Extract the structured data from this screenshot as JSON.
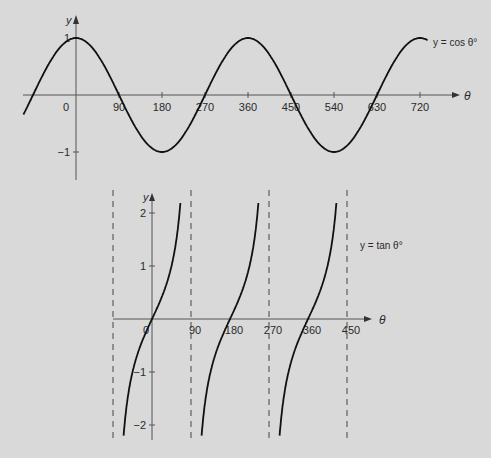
{
  "chart_data": [
    {
      "type": "line",
      "title": "",
      "legend_label": "y = cos θ°",
      "xlabel": "θ",
      "ylabel": "y",
      "x_ticks": [
        0,
        90,
        180,
        270,
        360,
        450,
        540,
        630,
        720
      ],
      "y_ticks": [
        1,
        -1
      ],
      "xlim": [
        -110,
        737
      ],
      "ylim": [
        -1.5,
        1.3
      ],
      "grid": false,
      "function": "cos",
      "series": [
        {
          "name": "y = cos θ°",
          "x": [
            -90,
            0,
            90,
            180,
            270,
            360,
            450,
            540,
            630,
            720
          ],
          "values": [
            0,
            1,
            0,
            -1,
            0,
            1,
            0,
            -1,
            0,
            1
          ]
        }
      ]
    },
    {
      "type": "line",
      "title": "",
      "legend_label": "y = tan θ°",
      "xlabel": "θ",
      "ylabel": "y",
      "x_ticks": [
        0,
        90,
        180,
        270,
        360,
        450
      ],
      "y_ticks": [
        2,
        1,
        -1,
        -2
      ],
      "asymptotes": [
        -90,
        90,
        270,
        450
      ],
      "xlim": [
        -90,
        450
      ],
      "ylim": [
        -2.2,
        2.2
      ],
      "grid": false,
      "function": "tan",
      "series": [
        {
          "name": "y = tan θ°",
          "x": [
            -65.6,
            -45,
            0,
            45,
            65.6,
            114.4,
            135,
            180,
            225,
            245.6,
            294.4,
            315,
            360,
            405,
            425.6
          ],
          "values": [
            -2.2,
            -1,
            0,
            1,
            2.2,
            -2.2,
            -1,
            0,
            1,
            2.2,
            -2.2,
            -1,
            0,
            1,
            2.2
          ]
        }
      ]
    }
  ],
  "labels": {
    "cos_label": "y = cos θ°",
    "tan_label": "y = tan θ°",
    "theta": "θ",
    "y": "y"
  },
  "colors": {
    "background": "#d9d9d9",
    "curve": "#111111",
    "axis": "#555555"
  }
}
